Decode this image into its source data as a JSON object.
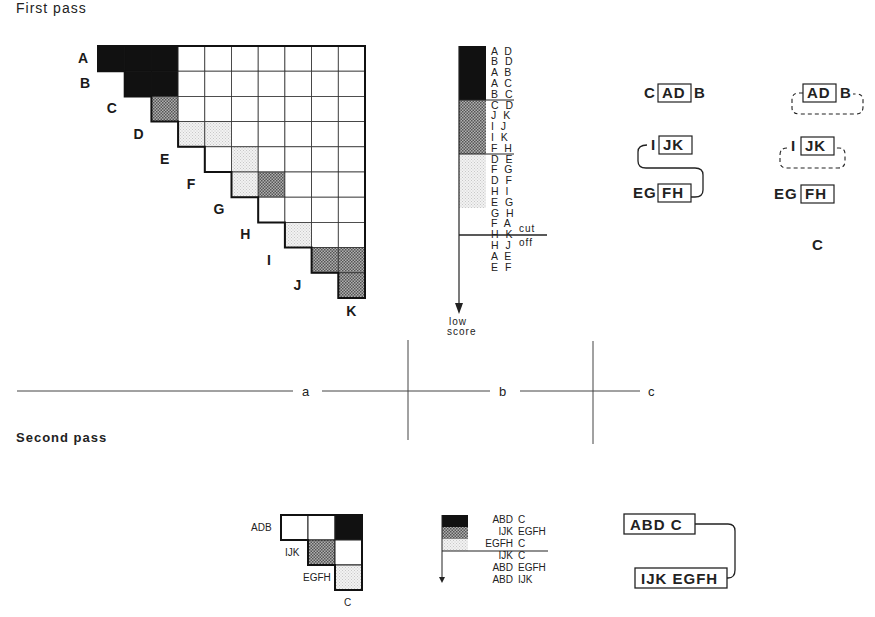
{
  "titles": {
    "first_pass": "First pass",
    "second_pass": "Second pass"
  },
  "colors": {
    "black": "#111111",
    "dark_stipple": "#8a8a8a",
    "light_stipple": "#e6e6e6",
    "line": "#222222"
  },
  "first_pass": {
    "row_labels": [
      "A",
      "B",
      "C",
      "D",
      "E",
      "F",
      "G",
      "H",
      "I",
      "J",
      "K"
    ],
    "shading": {
      "black": [
        [
          "A",
          "B"
        ],
        [
          "A",
          "C"
        ],
        [
          "A",
          "D"
        ],
        [
          "B",
          "C"
        ],
        [
          "B",
          "D"
        ]
      ],
      "dark": [
        [
          "C",
          "D"
        ],
        [
          "F",
          "H"
        ],
        [
          "I",
          "J"
        ],
        [
          "I",
          "K"
        ],
        [
          "J",
          "K"
        ]
      ],
      "light": [
        [
          "D",
          "E"
        ],
        [
          "D",
          "F"
        ],
        [
          "E",
          "G"
        ],
        [
          "F",
          "G"
        ],
        [
          "H",
          "I"
        ]
      ]
    },
    "ranked_list": {
      "groups": [
        {
          "level": "black",
          "pairs": [
            "A D",
            "B D",
            "A B",
            "A C",
            "B C"
          ]
        },
        {
          "level": "dark",
          "pairs": [
            "C D",
            "J K",
            "I J",
            "I K",
            "F H"
          ]
        },
        {
          "level": "light",
          "pairs": [
            "D E",
            "F G",
            "D F",
            "H I",
            "E G"
          ]
        },
        {
          "level": "none",
          "pairs": [
            "G H",
            "F A",
            "H K",
            "H J",
            "A E",
            "E F"
          ]
        }
      ],
      "cut_label": "cut",
      "off_label": "off",
      "arrow_label_1": "low",
      "arrow_label_2": "score"
    },
    "clusters_a": {
      "row1": {
        "left": "C",
        "boxed": "AD",
        "right": "B"
      },
      "row2": {
        "left": "I",
        "boxed": "JK"
      },
      "row3": {
        "left": "EG",
        "boxed": "FH"
      }
    },
    "clusters_b": {
      "row1": {
        "boxed": "AD",
        "right": "B"
      },
      "row2": {
        "left": "I",
        "boxed": "JK"
      },
      "row3": {
        "left": "EG",
        "boxed": "FH"
      },
      "row4": "C"
    }
  },
  "panel_labels": {
    "a": "a",
    "b": "b",
    "c": "c"
  },
  "second_pass": {
    "row_labels": [
      "ADB",
      "IJK",
      "EGFH"
    ],
    "col_label": "C",
    "ranked_list": [
      {
        "level": "black",
        "left": "ABD",
        "right": "C"
      },
      {
        "level": "dark",
        "left": "IJK",
        "right": "EGFH"
      },
      {
        "level": "light",
        "left": "EGFH",
        "right": "C"
      },
      {
        "level": "none",
        "left": "IJK",
        "right": "C"
      },
      {
        "level": "none",
        "left": "ABD",
        "right": "EGFH"
      },
      {
        "level": "none",
        "left": "ABD",
        "right": "IJK"
      }
    ],
    "final_clusters": {
      "top": "ABD C",
      "bottom": "IJK EGFH"
    }
  }
}
